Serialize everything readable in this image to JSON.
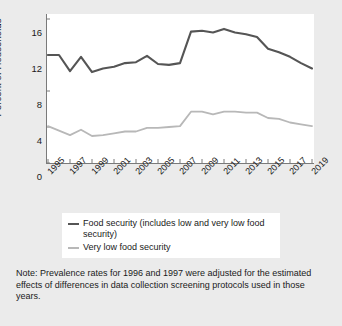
{
  "chart_data": {
    "type": "line",
    "title": "",
    "xlabel": "",
    "ylabel": "Percent of Households",
    "ylim": [
      0,
      16
    ],
    "xlim": [
      1995,
      2019
    ],
    "yticks": [
      0,
      4,
      8,
      12,
      16
    ],
    "xticks": [
      1995,
      1997,
      1999,
      2001,
      2003,
      2005,
      2007,
      2009,
      2011,
      2013,
      2015,
      2017,
      2019
    ],
    "grid": false,
    "legend_position": "below-axes",
    "x": [
      1995,
      1996,
      1997,
      1998,
      1999,
      2000,
      2001,
      2002,
      2003,
      2004,
      2005,
      2006,
      2007,
      2008,
      2009,
      2010,
      2011,
      2012,
      2013,
      2014,
      2015,
      2016,
      2017,
      2018,
      2019
    ],
    "series": [
      {
        "name": "Food security (includes low and very low food security)",
        "color": "#555555",
        "values": [
          12.0,
          12.0,
          10.2,
          11.8,
          10.1,
          10.5,
          10.7,
          11.1,
          11.2,
          11.9,
          11.0,
          10.9,
          11.1,
          14.6,
          14.7,
          14.5,
          14.9,
          14.5,
          14.3,
          14.0,
          12.7,
          12.3,
          11.8,
          11.1,
          10.5
        ],
        "units": "percent of households"
      },
      {
        "name": "Very low food security",
        "color": "#b8b8b8",
        "values": [
          4.1,
          3.6,
          3.1,
          3.7,
          3.0,
          3.1,
          3.3,
          3.5,
          3.5,
          3.9,
          3.9,
          4.0,
          4.1,
          5.7,
          5.7,
          5.4,
          5.7,
          5.7,
          5.6,
          5.6,
          5.0,
          4.9,
          4.5,
          4.3,
          4.1
        ],
        "units": "percent of households"
      }
    ]
  },
  "legend": {
    "items": [
      {
        "label": "Food security (includes low and very low food security)",
        "color": "#555555"
      },
      {
        "label": "Very low food security",
        "color": "#b8b8b8"
      }
    ]
  },
  "note": {
    "text": "Note: Prevalence rates for 1996 and 1997 were adjusted for the estimated effects of differences in data collection screening protocols used in those years."
  }
}
